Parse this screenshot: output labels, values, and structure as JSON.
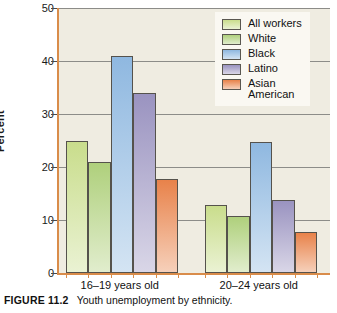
{
  "caption": {
    "figure_number": "FIGURE 11.2",
    "text": "Youth unemployment by ethnicity."
  },
  "chart_data": {
    "type": "bar",
    "title": "Youth unemployment by ethnicity.",
    "xlabel": "",
    "ylabel": "Percent",
    "ylim": [
      0,
      50
    ],
    "yticks": [
      0,
      10,
      20,
      30,
      40,
      50
    ],
    "ytick_labels": [
      "0",
      "10",
      "20",
      "30",
      "40",
      "50"
    ],
    "grid": true,
    "legend_position": "top-right",
    "categories": [
      "16–19 years old",
      "20–24 years old"
    ],
    "series": [
      {
        "name": "All workers",
        "values": [
          25.0,
          12.8
        ],
        "color": "#c9dd8c"
      },
      {
        "name": "White",
        "values": [
          21.0,
          10.8
        ],
        "color": "#afd07c"
      },
      {
        "name": "Black",
        "values": [
          41.0,
          24.8
        ],
        "color": "#8fb8e0"
      },
      {
        "name": "Latino",
        "values": [
          34.0,
          13.8
        ],
        "color": "#9a93c0"
      },
      {
        "name": "Asian\nAmerican",
        "values": [
          17.8,
          7.8
        ],
        "color": "#e8824a"
      }
    ]
  },
  "colors": {
    "plot_background": "#efece1",
    "axis": "#d98c4a",
    "gridline": "#8c8c88",
    "legend_background": "#faf8f2",
    "bar_border": "#55524c"
  }
}
